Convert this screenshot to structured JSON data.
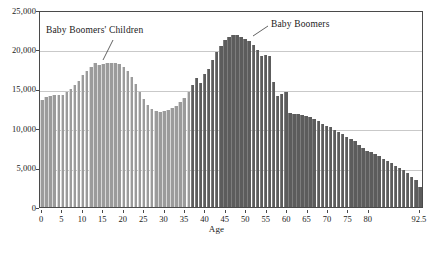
{
  "chart_data": {
    "type": "bar",
    "title": "",
    "xlabel": "Age",
    "ylabel": "",
    "ylim": [
      0,
      25000
    ],
    "xlim": [
      0,
      93
    ],
    "grid": true,
    "legend_position": "none",
    "y_ticks": [
      0,
      5000,
      10000,
      15000,
      20000,
      25000
    ],
    "y_tick_labels": [
      "0",
      "5,000",
      "10,000",
      "15,000",
      "20,000",
      "25,000"
    ],
    "x_ticks": [
      0,
      5,
      10,
      15,
      20,
      25,
      30,
      35,
      40,
      45,
      50,
      55,
      60,
      65,
      70,
      75,
      80,
      92.5
    ],
    "x_tick_labels": [
      "0",
      "5",
      "10",
      "15",
      "20",
      "25",
      "30",
      "35",
      "40",
      "45",
      "50",
      "55",
      "60",
      "65",
      "70",
      "75",
      "80",
      "92.5"
    ],
    "annotations": [
      {
        "text": "Baby Boomers' Children",
        "x": 13,
        "y": 23800
      },
      {
        "text": "Baby Boomers",
        "x": 49,
        "y": 23200
      }
    ],
    "series": [
      {
        "name": "Population by single year of age",
        "categories": [
          0,
          1,
          2,
          3,
          4,
          5,
          6,
          7,
          8,
          9,
          10,
          11,
          12,
          13,
          14,
          15,
          16,
          17,
          18,
          19,
          20,
          21,
          22,
          23,
          24,
          25,
          26,
          27,
          28,
          29,
          30,
          31,
          32,
          33,
          34,
          35,
          36,
          37,
          38,
          39,
          40,
          41,
          42,
          43,
          44,
          45,
          46,
          47,
          48,
          49,
          50,
          51,
          52,
          53,
          54,
          55,
          56,
          57,
          58,
          59,
          60,
          61,
          62,
          63,
          64,
          65,
          66,
          67,
          68,
          69,
          70,
          71,
          72,
          73,
          74,
          75,
          76,
          77,
          78,
          79,
          80,
          81,
          82,
          83,
          84,
          85,
          86,
          87,
          88,
          89,
          90,
          91,
          92,
          93
        ],
        "values": [
          13700,
          14100,
          14200,
          14300,
          14300,
          14400,
          14700,
          15100,
          15600,
          16200,
          16900,
          17500,
          18000,
          18400,
          18200,
          18300,
          18400,
          18500,
          18400,
          18300,
          18000,
          17500,
          16700,
          15800,
          14700,
          13800,
          13100,
          12600,
          12300,
          12200,
          12300,
          12500,
          12700,
          13000,
          13400,
          14000,
          14700,
          15600,
          16600,
          15900,
          17000,
          17700,
          18800,
          19900,
          20700,
          21400,
          21800,
          22000,
          22000,
          21800,
          21600,
          21300,
          20800,
          20100,
          19400,
          19500,
          19400,
          16000,
          14200,
          14500,
          14700,
          12000,
          11900,
          11900,
          11800,
          11700,
          11500,
          11300,
          11000,
          10700,
          10400,
          10200,
          9900,
          9600,
          9300,
          9000,
          8700,
          8400,
          8000,
          7600,
          7200,
          7100,
          6800,
          6500,
          6200,
          5900,
          5600,
          5300,
          5000,
          4700,
          4300,
          3900,
          3400,
          2600
        ],
        "color_light": "#9b9b9b",
        "color_dark": "#5c5c5c",
        "dark_from_age": 37
      }
    ]
  },
  "colors": {
    "bar_light": "#9b9b9b",
    "bar_dark": "#5c5c5c",
    "gridline": "#c9c9c9",
    "frame": "#4a4a4a",
    "text": "#1a1a1a"
  }
}
